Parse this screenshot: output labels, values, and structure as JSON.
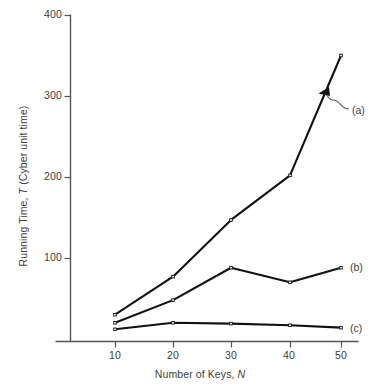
{
  "chart_data": {
    "type": "line",
    "title": "",
    "subtitle": "",
    "xlabel": "Number of Keys, N",
    "xlabel_text": "Number of Keys, ",
    "xlabel_italic": "N",
    "ylabel": "Running Time, T (Cyber unit time)",
    "ylabel_prefix": "Running Time, ",
    "ylabel_italic": "T",
    "ylabel_suffix": " (Cyber unit time)",
    "x": [
      10,
      20,
      30,
      40,
      50
    ],
    "xticks": [
      "10",
      "20",
      "30",
      "40",
      "50"
    ],
    "yticks": [
      "100",
      "200",
      "300",
      "400"
    ],
    "ytick_values": [
      100,
      200,
      300,
      400
    ],
    "xlim": [
      5,
      55
    ],
    "ylim": [
      0,
      400
    ],
    "grid": false,
    "legend_position": "right-inline-end-labels",
    "series": [
      {
        "name": "(a)",
        "label": "(a)",
        "color": "#111111",
        "values": [
          30,
          77,
          147,
          202,
          350
        ],
        "annotated": true
      },
      {
        "name": "(b)",
        "label": "(b)",
        "color": "#111111",
        "values": [
          20,
          48,
          88,
          70,
          88
        ],
        "annotated": false
      },
      {
        "name": "(c)",
        "label": "(c)",
        "color": "#111111",
        "values": [
          12,
          20,
          19,
          17,
          14
        ],
        "annotated": false
      }
    ],
    "annotations": [
      {
        "text": "(a)",
        "target_series": "(a)",
        "target_x": 47,
        "target_y": 300,
        "style": "curly-leader-arrow"
      }
    ]
  },
  "colors": {
    "line": "#111111",
    "axis": "#555555",
    "text": "#3d3d3d",
    "background": "#ffffff"
  }
}
